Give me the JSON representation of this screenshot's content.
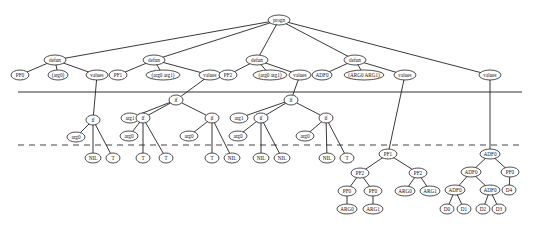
{
  "diagram": {
    "type": "program-tree",
    "separators": {
      "solid_y": 92,
      "dashed_y": 145
    },
    "nodes": [
      {
        "id": "progn",
        "label": "progn",
        "x": 279,
        "y": 20,
        "rx": 11
      },
      {
        "id": "defun0",
        "label": "defun",
        "x": 55,
        "y": 60,
        "rx": 11
      },
      {
        "id": "pf0_name",
        "label": "PF0",
        "x": 20,
        "y": 75,
        "rx": 9
      },
      {
        "id": "pf0_args",
        "label": "(arg0)",
        "x": 58,
        "y": 75,
        "rx": 10
      },
      {
        "id": "pf0_values",
        "label": "values",
        "x": 97,
        "y": 75,
        "rx": 11
      },
      {
        "id": "defun1",
        "label": "defun",
        "x": 154,
        "y": 60,
        "rx": 11
      },
      {
        "id": "pf1_name",
        "label": "PF1",
        "x": 118,
        "y": 75,
        "rx": 9
      },
      {
        "id": "pf1_args",
        "label": "(arg0 arg1)",
        "x": 163,
        "y": 75,
        "rx": 17
      },
      {
        "id": "pf1_values",
        "label": "values",
        "x": 210,
        "y": 75,
        "rx": 11
      },
      {
        "id": "defun2",
        "label": "defun",
        "x": 257,
        "y": 60,
        "rx": 11
      },
      {
        "id": "pf2_name",
        "label": "PF2",
        "x": 228,
        "y": 75,
        "rx": 9
      },
      {
        "id": "pf2_args",
        "label": "(arg0 arg1)",
        "x": 270,
        "y": 75,
        "rx": 17
      },
      {
        "id": "pf2_values",
        "label": "values",
        "x": 300,
        "y": 75,
        "rx": 11
      },
      {
        "id": "defun3",
        "label": "defun",
        "x": 355,
        "y": 60,
        "rx": 11
      },
      {
        "id": "adf0_name",
        "label": "ADF0",
        "x": 322,
        "y": 75,
        "rx": 10
      },
      {
        "id": "adf0_args",
        "label": "(ARG0 ARG1)",
        "x": 364,
        "y": 75,
        "rx": 20
      },
      {
        "id": "adf0_values",
        "label": "values",
        "x": 405,
        "y": 75,
        "rx": 11
      },
      {
        "id": "main_values",
        "label": "values",
        "x": 490,
        "y": 75,
        "rx": 11
      },
      {
        "id": "if0",
        "label": "if",
        "x": 93,
        "y": 120,
        "rx": 7
      },
      {
        "id": "if0_arg",
        "label": "arg0",
        "x": 76,
        "y": 137,
        "rx": 9
      },
      {
        "id": "if0_nil",
        "label": "NIL",
        "x": 93,
        "y": 158,
        "rx": 8
      },
      {
        "id": "if0_t",
        "label": "T",
        "x": 113,
        "y": 158,
        "rx": 7
      },
      {
        "id": "if1",
        "label": "if",
        "x": 176,
        "y": 100,
        "rx": 7
      },
      {
        "id": "if1_arg",
        "label": "arg1",
        "x": 130,
        "y": 118,
        "rx": 9
      },
      {
        "id": "if1a",
        "label": "if",
        "x": 143,
        "y": 118,
        "rx": 7
      },
      {
        "id": "if1a_arg",
        "label": "arg0",
        "x": 129,
        "y": 136,
        "rx": 9
      },
      {
        "id": "if1a_t1",
        "label": "T",
        "x": 143,
        "y": 158,
        "rx": 7
      },
      {
        "id": "if1a_t2",
        "label": "T",
        "x": 166,
        "y": 158,
        "rx": 7
      },
      {
        "id": "if1b",
        "label": "if",
        "x": 212,
        "y": 118,
        "rx": 7
      },
      {
        "id": "if1b_arg",
        "label": "arg0",
        "x": 189,
        "y": 136,
        "rx": 9
      },
      {
        "id": "if1b_t",
        "label": "T",
        "x": 212,
        "y": 158,
        "rx": 7
      },
      {
        "id": "if1b_nil",
        "label": "NIL",
        "x": 232,
        "y": 158,
        "rx": 8
      },
      {
        "id": "if2",
        "label": "if",
        "x": 291,
        "y": 100,
        "rx": 7
      },
      {
        "id": "if2_arg",
        "label": "arg1",
        "x": 239,
        "y": 118,
        "rx": 9
      },
      {
        "id": "if2a",
        "label": "if",
        "x": 261,
        "y": 118,
        "rx": 7
      },
      {
        "id": "if2a_arg",
        "label": "arg0",
        "x": 238,
        "y": 136,
        "rx": 9
      },
      {
        "id": "if2a_nil1",
        "label": "NIL",
        "x": 261,
        "y": 158,
        "rx": 8
      },
      {
        "id": "if2a_nil2",
        "label": "NIL",
        "x": 282,
        "y": 158,
        "rx": 8
      },
      {
        "id": "if2b",
        "label": "if",
        "x": 326,
        "y": 118,
        "rx": 7
      },
      {
        "id": "if2b_arg",
        "label": "arg0",
        "x": 305,
        "y": 136,
        "rx": 9
      },
      {
        "id": "if2b_nil",
        "label": "NIL",
        "x": 327,
        "y": 158,
        "rx": 8
      },
      {
        "id": "if2b_t",
        "label": "T",
        "x": 347,
        "y": 158,
        "rx": 7
      },
      {
        "id": "pf1_call",
        "label": "PF1",
        "x": 388,
        "y": 154,
        "rx": 9
      },
      {
        "id": "pf2_left",
        "label": "PF2",
        "x": 360,
        "y": 173,
        "rx": 9
      },
      {
        "id": "pf0_a",
        "label": "PF0",
        "x": 347,
        "y": 191,
        "rx": 9
      },
      {
        "id": "arg0_leaf",
        "label": "ARG0",
        "x": 347,
        "y": 209,
        "rx": 10
      },
      {
        "id": "pf0_b",
        "label": "PF0",
        "x": 373,
        "y": 191,
        "rx": 9
      },
      {
        "id": "arg1_leaf",
        "label": "ARG1",
        "x": 373,
        "y": 209,
        "rx": 10
      },
      {
        "id": "pf2_right",
        "label": "PF2",
        "x": 418,
        "y": 173,
        "rx": 9
      },
      {
        "id": "arg0_r",
        "label": "ARG0",
        "x": 405,
        "y": 191,
        "rx": 10
      },
      {
        "id": "arg1_r",
        "label": "ARG1",
        "x": 430,
        "y": 191,
        "rx": 10
      },
      {
        "id": "adf0_root",
        "label": "ADF0",
        "x": 490,
        "y": 154,
        "rx": 10
      },
      {
        "id": "adf0_l",
        "label": "ADF0",
        "x": 471,
        "y": 172,
        "rx": 10
      },
      {
        "id": "pf0_r",
        "label": "PF0",
        "x": 510,
        "y": 172,
        "rx": 9
      },
      {
        "id": "adf0_ll",
        "label": "ADF0",
        "x": 455,
        "y": 190,
        "rx": 10
      },
      {
        "id": "adf0_lr",
        "label": "ADF0",
        "x": 490,
        "y": 190,
        "rx": 10
      },
      {
        "id": "d4",
        "label": "D4",
        "x": 509,
        "y": 190,
        "rx": 7
      },
      {
        "id": "d0",
        "label": "D0",
        "x": 447,
        "y": 209,
        "rx": 7
      },
      {
        "id": "d1",
        "label": "D1",
        "x": 464,
        "y": 209,
        "rx": 7
      },
      {
        "id": "d2",
        "label": "D2",
        "x": 483,
        "y": 209,
        "rx": 7
      },
      {
        "id": "d3",
        "label": "D3",
        "x": 499,
        "y": 209,
        "rx": 7
      }
    ],
    "edges": [
      [
        "progn",
        "defun0"
      ],
      [
        "progn",
        "defun1"
      ],
      [
        "progn",
        "defun2"
      ],
      [
        "progn",
        "defun3"
      ],
      [
        "progn",
        "main_values"
      ],
      [
        "defun0",
        "pf0_name"
      ],
      [
        "defun0",
        "pf0_args"
      ],
      [
        "defun0",
        "pf0_values"
      ],
      [
        "defun1",
        "pf1_name"
      ],
      [
        "defun1",
        "pf1_args"
      ],
      [
        "defun1",
        "pf1_values"
      ],
      [
        "defun2",
        "pf2_name"
      ],
      [
        "defun2",
        "pf2_args"
      ],
      [
        "defun2",
        "pf2_values"
      ],
      [
        "defun3",
        "adf0_name"
      ],
      [
        "defun3",
        "adf0_args"
      ],
      [
        "defun3",
        "adf0_values"
      ],
      [
        "pf0_values",
        "if0"
      ],
      [
        "if0",
        "if0_arg"
      ],
      [
        "if0",
        "if0_nil"
      ],
      [
        "if0",
        "if0_t"
      ],
      [
        "pf1_values",
        "if1"
      ],
      [
        "if1",
        "if1_arg"
      ],
      [
        "if1",
        "if1a"
      ],
      [
        "if1",
        "if1b"
      ],
      [
        "if1a",
        "if1a_arg"
      ],
      [
        "if1a",
        "if1a_t1"
      ],
      [
        "if1a",
        "if1a_t2"
      ],
      [
        "if1b",
        "if1b_arg"
      ],
      [
        "if1b",
        "if1b_t"
      ],
      [
        "if1b",
        "if1b_nil"
      ],
      [
        "pf2_values",
        "if2"
      ],
      [
        "if2",
        "if2_arg"
      ],
      [
        "if2",
        "if2a"
      ],
      [
        "if2",
        "if2b"
      ],
      [
        "if2a",
        "if2a_arg"
      ],
      [
        "if2a",
        "if2a_nil1"
      ],
      [
        "if2a",
        "if2a_nil2"
      ],
      [
        "if2b",
        "if2b_arg"
      ],
      [
        "if2b",
        "if2b_nil"
      ],
      [
        "if2b",
        "if2b_t"
      ],
      [
        "adf0_values",
        "pf1_call"
      ],
      [
        "pf1_call",
        "pf2_left"
      ],
      [
        "pf1_call",
        "pf2_right"
      ],
      [
        "pf2_left",
        "pf0_a"
      ],
      [
        "pf2_left",
        "pf0_b"
      ],
      [
        "pf0_a",
        "arg0_leaf"
      ],
      [
        "pf0_b",
        "arg1_leaf"
      ],
      [
        "pf2_right",
        "arg0_r"
      ],
      [
        "pf2_right",
        "arg1_r"
      ],
      [
        "main_values",
        "adf0_root"
      ],
      [
        "adf0_root",
        "adf0_l"
      ],
      [
        "adf0_root",
        "pf0_r"
      ],
      [
        "adf0_l",
        "adf0_ll"
      ],
      [
        "adf0_l",
        "adf0_lr"
      ],
      [
        "pf0_r",
        "d4"
      ],
      [
        "adf0_ll",
        "d0"
      ],
      [
        "adf0_ll",
        "d1"
      ],
      [
        "adf0_lr",
        "d2"
      ],
      [
        "adf0_lr",
        "d3"
      ]
    ]
  }
}
